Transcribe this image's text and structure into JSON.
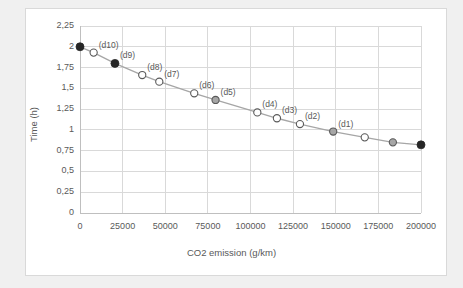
{
  "chart_data": {
    "type": "scatter",
    "title": "",
    "xlabel": "CO2 emission (g/km)",
    "ylabel": "Time (h)",
    "xlim": [
      0,
      200000
    ],
    "ylim": [
      0,
      2.25
    ],
    "grid": true,
    "legend": "none",
    "decimal_separator": ",",
    "xticks": [
      0,
      25000,
      50000,
      75000,
      100000,
      125000,
      150000,
      175000,
      200000
    ],
    "xtick_labels": [
      "0",
      "25000",
      "50000",
      "75000",
      "100000",
      "125000",
      "150000",
      "175000",
      "200000"
    ],
    "yticks": [
      0,
      0.25,
      0.5,
      0.75,
      1,
      1.25,
      1.5,
      1.75,
      2,
      2.25
    ],
    "ytick_labels": [
      "0",
      "0,25",
      "0,5",
      "0,75",
      "1",
      "1,25",
      "1,5",
      "1,75",
      "2",
      "2,25"
    ],
    "marker_colors": {
      "filled": "#262626",
      "hollow": "#ffffff",
      "gray": "#a6a6a6"
    },
    "line_color": "#a6a6a6",
    "points": [
      {
        "x": 0,
        "y": 2.0,
        "label": "",
        "style": "filled"
      },
      {
        "x": 8000,
        "y": 1.93,
        "label": "(d10)",
        "style": "hollow"
      },
      {
        "x": 20500,
        "y": 1.8,
        "label": "(d9)",
        "style": "filled"
      },
      {
        "x": 36500,
        "y": 1.66,
        "label": "(d8)",
        "style": "hollow"
      },
      {
        "x": 46500,
        "y": 1.58,
        "label": "(d7)",
        "style": "hollow"
      },
      {
        "x": 67000,
        "y": 1.44,
        "label": "(d6)",
        "style": "hollow"
      },
      {
        "x": 79500,
        "y": 1.36,
        "label": "(d5)",
        "style": "gray"
      },
      {
        "x": 104000,
        "y": 1.21,
        "label": "(d4)",
        "style": "hollow"
      },
      {
        "x": 115500,
        "y": 1.14,
        "label": "(d3)",
        "style": "hollow"
      },
      {
        "x": 129000,
        "y": 1.07,
        "label": "(d2)",
        "style": "hollow"
      },
      {
        "x": 148500,
        "y": 0.98,
        "label": "(d1)",
        "style": "gray"
      },
      {
        "x": 167000,
        "y": 0.91,
        "label": "",
        "style": "hollow"
      },
      {
        "x": 183500,
        "y": 0.85,
        "label": "",
        "style": "gray"
      },
      {
        "x": 200000,
        "y": 0.82,
        "label": "",
        "style": "filled"
      }
    ]
  },
  "plot_geometry": {
    "left": 80,
    "right": 421,
    "top": 26,
    "bottom": 213
  }
}
